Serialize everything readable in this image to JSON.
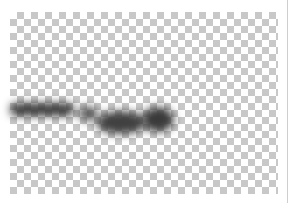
{
  "image": {
    "description": "Western blot band on transparent checkerboard background",
    "background": {
      "checker_light": "#ffffff",
      "checker_dark": "#c8c8c8"
    },
    "bands": [
      {
        "name": "band-left-streak",
        "x": 10,
        "y": 102,
        "w": 62,
        "h": 14,
        "color": "#3a3a3a"
      },
      {
        "name": "band-small-spot",
        "x": 78,
        "y": 106,
        "w": 20,
        "h": 16,
        "color": "#555555"
      },
      {
        "name": "band-middle",
        "x": 96,
        "y": 112,
        "w": 48,
        "h": 22,
        "color": "#3e3e3e"
      },
      {
        "name": "band-right",
        "x": 142,
        "y": 108,
        "w": 32,
        "h": 24,
        "color": "#3a3a3a"
      }
    ]
  }
}
